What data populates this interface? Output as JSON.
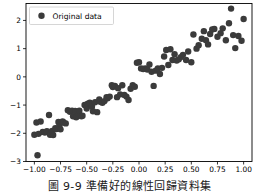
{
  "figure": {
    "background_color": "#ffffff",
    "axes_color": "#000000",
    "marker_color": "#3b3b3b",
    "legend": {
      "entries": [
        {
          "label": "Original data",
          "marker": "circle-marker-icon",
          "color": "#3b3b3b"
        }
      ],
      "position": "upper left",
      "frame": true
    }
  },
  "caption": {
    "text": "圖 9-9 準備好的線性回歸資料集"
  },
  "chart_data": {
    "type": "scatter",
    "title": "",
    "xlabel": "",
    "ylabel": "",
    "xlim": [
      -1.08,
      1.08
    ],
    "ylim": [
      -3.0,
      2.6
    ],
    "xticks": [
      -1.0,
      -0.75,
      -0.5,
      -0.25,
      0.0,
      0.25,
      0.5,
      0.75,
      1.0
    ],
    "xtick_labels": [
      "-1.00",
      "-0.75",
      "-0.50",
      "-0.25",
      "0.00",
      "0.25",
      "0.50",
      "0.75",
      "1.00"
    ],
    "yticks": [
      2,
      1,
      0,
      -1,
      -2,
      -3
    ],
    "ytick_labels": [
      "2",
      "1",
      "0",
      "-1",
      "-2",
      "-3"
    ],
    "grid": false,
    "legend_position": "upper left",
    "series": [
      {
        "name": "Original data",
        "color": "#3b3b3b",
        "marker": "o",
        "marker_size": 3.2,
        "x": [
          -1.0,
          -0.98,
          -0.97,
          -0.96,
          -0.94,
          -0.92,
          -0.9,
          -0.88,
          -0.86,
          -0.85,
          -0.83,
          -0.82,
          -0.8,
          -0.79,
          -0.77,
          -0.76,
          -0.75,
          -0.73,
          -0.72,
          -0.7,
          -0.68,
          -0.66,
          -0.64,
          -0.63,
          -0.61,
          -0.6,
          -0.58,
          -0.57,
          -0.55,
          -0.54,
          -0.52,
          -0.5,
          -0.49,
          -0.47,
          -0.45,
          -0.44,
          -0.42,
          -0.4,
          -0.38,
          -0.37,
          -0.35,
          -0.33,
          -0.31,
          -0.3,
          -0.28,
          -0.26,
          -0.25,
          -0.23,
          -0.21,
          -0.2,
          -0.18,
          -0.16,
          -0.14,
          -0.12,
          -0.1,
          -0.08,
          -0.06,
          -0.04,
          -0.02,
          0.0,
          0.02,
          0.04,
          0.06,
          0.08,
          0.1,
          0.12,
          0.14,
          0.16,
          0.18,
          0.2,
          0.22,
          0.24,
          0.26,
          0.28,
          0.3,
          0.32,
          0.34,
          0.36,
          0.38,
          0.4,
          0.42,
          0.45,
          0.47,
          0.5,
          0.52,
          0.55,
          0.57,
          0.6,
          0.62,
          0.64,
          0.66,
          0.68,
          0.7,
          0.72,
          0.75,
          0.78,
          0.8,
          0.83,
          0.86,
          0.88,
          0.9,
          0.92,
          0.95,
          0.98,
          1.0
        ],
        "y": [
          -2.05,
          -1.62,
          -2.78,
          -2.02,
          -1.58,
          -1.95,
          -1.97,
          -1.93,
          -1.35,
          -2.05,
          -1.92,
          -2.06,
          -1.82,
          -1.85,
          -1.6,
          -1.72,
          -1.86,
          -1.58,
          -1.62,
          -1.65,
          -1.18,
          -1.24,
          -1.2,
          -1.4,
          -1.21,
          -1.43,
          -1.38,
          -1.2,
          -1.4,
          -1.38,
          -1.0,
          -1.12,
          -0.95,
          -0.92,
          -1.05,
          -1.22,
          -0.9,
          -1.25,
          -0.8,
          -0.88,
          -0.92,
          -0.86,
          -0.72,
          -0.76,
          -0.7,
          -0.3,
          -0.36,
          -0.32,
          -0.72,
          -0.4,
          -0.62,
          -0.3,
          -0.64,
          -0.7,
          -0.82,
          -0.42,
          -0.3,
          -0.35,
          0.5,
          0.52,
          0.3,
          0.28,
          0.3,
          0.26,
          0.44,
          0.18,
          -0.32,
          0.22,
          0.3,
          0.1,
          0.32,
          0.72,
          0.95,
          0.42,
          0.98,
          0.6,
          0.8,
          0.58,
          0.62,
          0.7,
          0.78,
          0.6,
          0.9,
          0.52,
          1.5,
          1.0,
          1.12,
          1.35,
          1.62,
          1.3,
          1.15,
          1.52,
          1.68,
          1.7,
          1.42,
          1.55,
          1.72,
          1.3,
          1.9,
          2.42,
          1.48,
          1.02,
          1.45,
          1.28,
          2.05
        ]
      }
    ]
  }
}
